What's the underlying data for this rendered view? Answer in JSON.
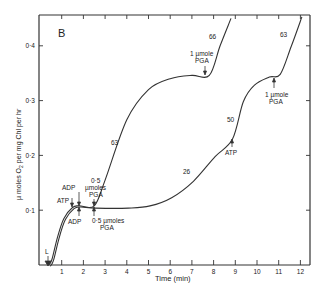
{
  "chart_data": {
    "type": "line",
    "panel_label": "B",
    "title": "",
    "xlabel": "Time (min)",
    "ylabel": "µ moles O₂ per mg Chl per hr",
    "xlim": [
      0,
      12.3
    ],
    "ylim": [
      0,
      0.45
    ],
    "x_ticks": [
      "1",
      "2",
      "3",
      "4",
      "5",
      "6",
      "7",
      "8",
      "9",
      "10",
      "11",
      "12"
    ],
    "y_ticks": [
      "0·1",
      "0·2",
      "0·3",
      "0·4"
    ],
    "grid": false,
    "legend": null,
    "series": [
      {
        "name": "upper trace (0.5 µmoles PGA at ~2.5 min)",
        "x": [
          0.4,
          0.55,
          0.8,
          1.1,
          1.5,
          1.8,
          2.5,
          3.0,
          4.0,
          5.0,
          6.0,
          7.0,
          7.8,
          8.3,
          8.8
        ],
        "y": [
          0.0,
          0.01,
          0.05,
          0.085,
          0.105,
          0.108,
          0.108,
          0.155,
          0.265,
          0.32,
          0.34,
          0.346,
          0.346,
          0.4,
          0.45
        ]
      },
      {
        "name": "lower trace (0.5 µmoles PGA at ~2.5 min, ATP at ~8.8 min)",
        "x": [
          0.4,
          0.55,
          0.8,
          1.1,
          1.5,
          1.8,
          2.5,
          4.0,
          5.0,
          6.0,
          7.0,
          8.0,
          8.8,
          9.3,
          9.8,
          10.5,
          11.0,
          11.5,
          12.0
        ],
        "y": [
          0.0,
          0.01,
          0.05,
          0.085,
          0.105,
          0.108,
          0.106,
          0.106,
          0.11,
          0.125,
          0.155,
          0.2,
          0.232,
          0.3,
          0.33,
          0.345,
          0.35,
          0.4,
          0.455
        ]
      }
    ],
    "rate_labels": [
      {
        "text": "63",
        "x": 3.4,
        "y": 0.2
      },
      {
        "text": "66",
        "x": 7.9,
        "y": 0.41
      },
      {
        "text": "26",
        "x": 7.1,
        "y": 0.18
      },
      {
        "text": "50",
        "x": 8.4,
        "y": 0.275
      },
      {
        "text": "63",
        "x": 11.0,
        "y": 0.415
      }
    ],
    "annotations": [
      {
        "text": "L",
        "x": 0.4,
        "y": 0.0,
        "arrow": "down"
      },
      {
        "text": "ATP",
        "x": 1.5,
        "y": 0.108,
        "arrow": "down"
      },
      {
        "text": "ADP",
        "x": 1.8,
        "y": 0.108,
        "arrow": "down",
        "position": "above"
      },
      {
        "text": "ADP",
        "x": 1.8,
        "y": 0.108,
        "arrow": "up",
        "position": "below"
      },
      {
        "text": "0·5 µmoles PGA",
        "x": 2.5,
        "y": 0.108,
        "arrow": "down",
        "position": "above"
      },
      {
        "text": "0·5 µmoles PGA",
        "x": 2.5,
        "y": 0.106,
        "arrow": "up",
        "position": "below"
      },
      {
        "text": "1 µmole PGA",
        "x": 7.8,
        "y": 0.346,
        "arrow": "down",
        "position": "above"
      },
      {
        "text": "ATP",
        "x": 8.8,
        "y": 0.232,
        "arrow": "up",
        "position": "below"
      },
      {
        "text": "1 µmole PGA",
        "x": 10.9,
        "y": 0.35,
        "arrow": "up",
        "position": "below"
      }
    ]
  },
  "labels": {
    "panel": "B",
    "xlabel": "Time (min)",
    "ylabel_main": "µ moles O",
    "ylabel_sub": "2",
    "ylabel_rest": " per mg Chl per hr",
    "l": "L",
    "atp1": "ATP",
    "adp_top": "ADP",
    "adp_bottom": "ADP",
    "pga_top_1": "0·5",
    "pga_top_2": "µmoles",
    "pga_top_3": "PGA",
    "pga_bot_1": "0·5 µmoles",
    "pga_bot_2": "PGA",
    "pga_up_1": "1 µmole",
    "pga_up_2": "PGA",
    "atp2": "ATP",
    "pga_r_1": "1 µmole",
    "pga_r_2": "PGA",
    "r63a": "63",
    "r66": "66",
    "r26": "26",
    "r50": "50",
    "r63b": "63"
  }
}
